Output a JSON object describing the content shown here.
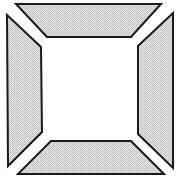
{
  "figure": {
    "description": "Square frame composed of four shaded trapezoidal panels separated by diagonal gaps at the corners, with an empty white square center",
    "colors": {
      "background": "#ffffff",
      "panel_fill": "#d9d9d9",
      "panel_stroke": "#1a1a1a",
      "center": "#ffffff"
    },
    "panels": [
      {
        "name": "top",
        "points": "16,4 161,4 131,37 47,37"
      },
      {
        "name": "left",
        "points": "7,15 41,47 42,132 8,166"
      },
      {
        "name": "right",
        "points": "173,13 173,168 138,134 138,46"
      },
      {
        "name": "bottom",
        "points": "51,141 131,141 164,174 18,174"
      }
    ]
  }
}
